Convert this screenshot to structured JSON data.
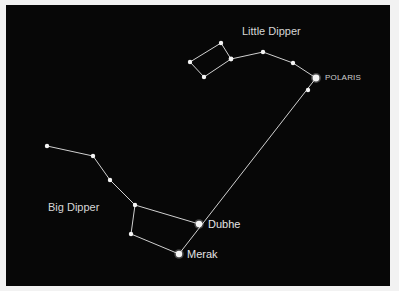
{
  "colors": {
    "background": "#070707",
    "frame": "#f2f2f2",
    "line": "#d0d0d0",
    "star": "#f4f4f4",
    "label": "#d6d6d6"
  },
  "labels": {
    "little_dipper": "Little Dipper",
    "big_dipper": "Big Dipper",
    "polaris": "POLARIS",
    "dubhe": "Dubhe",
    "merak": "Merak"
  },
  "constellations": {
    "little_dipper": {
      "name": "Little Dipper",
      "stars": [
        {
          "x": 190,
          "y": 62,
          "r": 2.2
        },
        {
          "x": 221,
          "y": 43,
          "r": 2.2
        },
        {
          "x": 231,
          "y": 59,
          "r": 2.4
        },
        {
          "x": 204,
          "y": 77,
          "r": 2.2
        },
        {
          "x": 263,
          "y": 52,
          "r": 2.2
        },
        {
          "x": 293,
          "y": 63,
          "r": 2.2
        },
        {
          "x": 316,
          "y": 78,
          "r": 3.4,
          "name": "POLARIS"
        }
      ],
      "lines": [
        [
          0,
          1
        ],
        [
          1,
          2
        ],
        [
          2,
          3
        ],
        [
          3,
          0
        ],
        [
          2,
          4
        ],
        [
          4,
          5
        ],
        [
          5,
          6
        ]
      ]
    },
    "big_dipper": {
      "name": "Big Dipper",
      "stars": [
        {
          "x": 47,
          "y": 146,
          "r": 2.2
        },
        {
          "x": 93,
          "y": 156,
          "r": 2.2
        },
        {
          "x": 110,
          "y": 180,
          "r": 2.2
        },
        {
          "x": 135,
          "y": 205,
          "r": 2.2
        },
        {
          "x": 131,
          "y": 234,
          "r": 2.2
        },
        {
          "x": 179,
          "y": 254,
          "r": 3.2,
          "name": "Merak"
        },
        {
          "x": 199,
          "y": 224,
          "r": 3.2,
          "name": "Dubhe"
        }
      ],
      "lines": [
        [
          0,
          1
        ],
        [
          1,
          2
        ],
        [
          2,
          3
        ],
        [
          3,
          4
        ],
        [
          4,
          5
        ],
        [
          3,
          6
        ]
      ]
    },
    "pointer": {
      "stars": [
        {
          "x": 308,
          "y": 90,
          "r": 2.2
        }
      ],
      "line": {
        "from": [
          179,
          254
        ],
        "to": [
          316,
          78
        ]
      }
    }
  }
}
